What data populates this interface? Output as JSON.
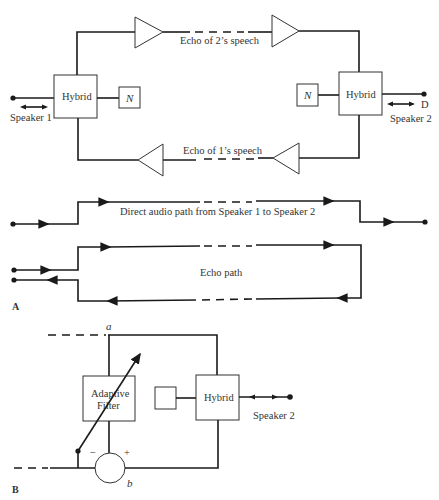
{
  "part_a": {
    "label": "A",
    "speaker1": "Speaker 1",
    "speaker2": "Speaker 2",
    "hybrid1": "Hybrid",
    "hybrid2": "Hybrid",
    "network1": "N",
    "network2": "N",
    "terminal_d": "D",
    "echo_top": "Echo of 2’s speech",
    "echo_bottom": "Echo of 1’s speech",
    "direct_path": "Direct audio path from Speaker 1 to Speaker 2",
    "echo_path": "Echo path"
  },
  "part_b": {
    "label": "B",
    "node_a": "a",
    "node_b": "b",
    "adaptive_line1": "Adaptive",
    "adaptive_line2": "Filter",
    "hybrid": "Hybrid",
    "speaker2": "Speaker 2",
    "minus": "−",
    "plus": "+"
  },
  "colors": {
    "line": "#1a1a1a",
    "text": "#333333",
    "background": "#ffffff"
  }
}
